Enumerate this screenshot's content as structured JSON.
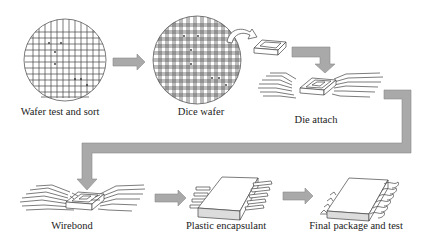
{
  "diagram": {
    "colors": {
      "background": "#ffffff",
      "line": "#444444",
      "arrow_fill": "#a9a9a9",
      "package_side": "#dcdcdc"
    },
    "steps": [
      {
        "id": "wafer-test-sort",
        "label": "Wafer test and sort",
        "icon": "wafer-grid-icon"
      },
      {
        "id": "dice-wafer",
        "label": "Dice wafer",
        "icon": "diced-wafer-icon"
      },
      {
        "id": "die-attach",
        "label": "Die attach",
        "icon": "leadframe-die-icon"
      },
      {
        "id": "wirebond",
        "label": "Wirebond",
        "icon": "wirebond-icon"
      },
      {
        "id": "plastic-encapsulant",
        "label": "Plastic encapsulant",
        "icon": "encapsulated-chip-icon"
      },
      {
        "id": "final-package-test",
        "label": "Final package and test",
        "icon": "final-package-icon"
      }
    ],
    "connectors": [
      {
        "from": "wafer-test-sort",
        "to": "dice-wafer",
        "type": "right-arrow"
      },
      {
        "from": "dice-wafer",
        "to": "die-attach",
        "type": "curved-arrow-then-down-arrow"
      },
      {
        "from": "die-attach",
        "to": "wirebond",
        "type": "return-elbow-arrow"
      },
      {
        "from": "wirebond",
        "to": "plastic-encapsulant",
        "type": "right-arrow"
      },
      {
        "from": "plastic-encapsulant",
        "to": "final-package-test",
        "type": "right-arrow"
      }
    ]
  }
}
